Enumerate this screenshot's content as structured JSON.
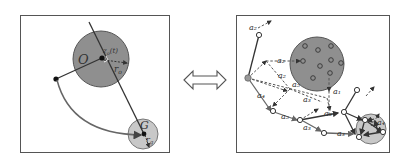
{
  "left_panel": {
    "obstacle_label": "O",
    "obstacle_center_label": "z_o(t)",
    "obstacle_radius_label": "r_o",
    "goal_label": "G",
    "goal_radius_label": "r_g"
  },
  "connector": {
    "icon": "double-arrow-icon"
  },
  "right_panel": {
    "action_labels": [
      "a_2",
      "a_2",
      "a_2",
      "a_5",
      "a_4",
      "a_3",
      "a_1",
      "a_5",
      "a_3",
      "a_3",
      "a_4",
      "a_5",
      "a_4"
    ],
    "top_label": "a_2",
    "labels": {
      "top": "a₂",
      "upper_dashed": "a₂",
      "mid_dashed": "a₂",
      "mid_dashed_b": "a₅",
      "left_lower": "a₄",
      "mid_right": "a₃",
      "near_obstacle": "a₁",
      "lower_mid": "a₅",
      "lower_bold": "a₃",
      "bottom_mid": "a₃",
      "bottom_right": "a₃",
      "goal_area": "a₄"
    }
  },
  "colors": {
    "obstacle_fill": "#8f8f8f",
    "goal_fill": "#c8c8c8",
    "line": "#333333",
    "arc": "#666666",
    "border": "#555555"
  }
}
